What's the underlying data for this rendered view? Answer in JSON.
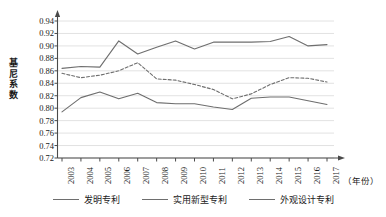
{
  "chart_data": {
    "type": "line",
    "title": "",
    "xlabel": "（年份）",
    "ylabel": "基尼系数",
    "grid": true,
    "legend_position": "bottom",
    "xlim": [
      2003,
      2017
    ],
    "ylim": [
      0.72,
      0.94
    ],
    "ytick_step": 0.02,
    "categories": [
      "2003",
      "2004",
      "2005",
      "2006",
      "2007",
      "2008",
      "2009",
      "2010",
      "2011",
      "2012",
      "2013",
      "2014",
      "2015",
      "2016",
      "2017"
    ],
    "ytick_labels": [
      "0.94",
      "0.92",
      "0.90",
      "0.88",
      "0.86",
      "0.84",
      "0.82",
      "0.80",
      "0.78",
      "0.76",
      "0.74",
      "0.72"
    ],
    "series": [
      {
        "name": "发明专利",
        "style": "solid",
        "color": "#6e6e6e",
        "values": [
          0.864,
          0.867,
          0.866,
          0.908,
          0.887,
          0.898,
          0.908,
          0.895,
          0.906,
          0.906,
          0.906,
          0.907,
          0.915,
          0.9,
          0.902
        ]
      },
      {
        "name": "实用新型专利",
        "style": "dashed",
        "color": "#6e6e6e",
        "values": [
          0.856,
          0.849,
          0.853,
          0.86,
          0.873,
          0.847,
          0.845,
          0.838,
          0.83,
          0.815,
          0.823,
          0.838,
          0.849,
          0.848,
          0.842
        ]
      },
      {
        "name": "外观设计专利",
        "style": "solid",
        "color": "#6e6e6e",
        "values": [
          0.794,
          0.817,
          0.826,
          0.815,
          0.824,
          0.809,
          0.807,
          0.807,
          0.802,
          0.798,
          0.816,
          0.818,
          0.818,
          0.812,
          0.806
        ]
      }
    ]
  },
  "axis": {
    "y_title_chars": [
      "基",
      "尼",
      "系",
      "数"
    ],
    "x_unit_label": "（年份）"
  },
  "legend": {
    "items": [
      {
        "label": "发明专利"
      },
      {
        "label": "实用新型专利"
      },
      {
        "label": "外观设计专利"
      }
    ]
  },
  "colors": {
    "line": "#6e6e6e",
    "grid": "#e2e2e2",
    "axis": "#4a4a4a",
    "text": "#1a1a1a"
  }
}
